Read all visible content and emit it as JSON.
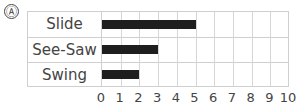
{
  "marker": "Ⓐ",
  "chart_data": {
    "type": "bar",
    "orientation": "horizontal",
    "categories": [
      "Slide",
      "See-Saw",
      "Swing"
    ],
    "values": [
      5,
      3,
      2
    ],
    "title": "",
    "xlabel": "",
    "ylabel": "",
    "xlim": [
      0,
      10
    ],
    "xticks": [
      "0",
      "1",
      "2",
      "3",
      "4",
      "5",
      "6",
      "7",
      "8",
      "9",
      "10"
    ],
    "grid": true,
    "bar_color": "#1e1e1e"
  }
}
